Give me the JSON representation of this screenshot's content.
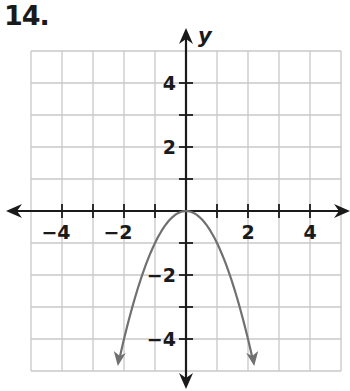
{
  "problem": {
    "number": "14."
  },
  "chart_data": {
    "type": "line",
    "title": "",
    "xlabel": "x",
    "ylabel": "y",
    "xlim": [
      -5,
      5
    ],
    "ylim": [
      -5,
      5
    ],
    "grid": true,
    "x_tick_labels": [
      "−4",
      "−2",
      "2",
      "4"
    ],
    "x_tick_values": [
      -4,
      -2,
      2,
      4
    ],
    "y_tick_labels": [
      "4",
      "2",
      "−2",
      "−4"
    ],
    "y_tick_values": [
      4,
      2,
      -2,
      -4
    ],
    "series": [
      {
        "name": "y = -x^2",
        "equation": "y = -x^2",
        "color": "#707070",
        "vertex": [
          0,
          0
        ],
        "x": [
          -2.2,
          -2,
          -1.5,
          -1,
          -0.5,
          0,
          0.5,
          1,
          1.5,
          2,
          2.2
        ],
        "y": [
          -4.84,
          -4,
          -2.25,
          -1,
          -0.25,
          0,
          -0.25,
          -1,
          -2.25,
          -4,
          -4.84
        ],
        "arrows_at_ends": true
      }
    ]
  },
  "colors": {
    "axis": "#1a1a1a",
    "grid": "#c8c8c8",
    "curve": "#707070"
  }
}
